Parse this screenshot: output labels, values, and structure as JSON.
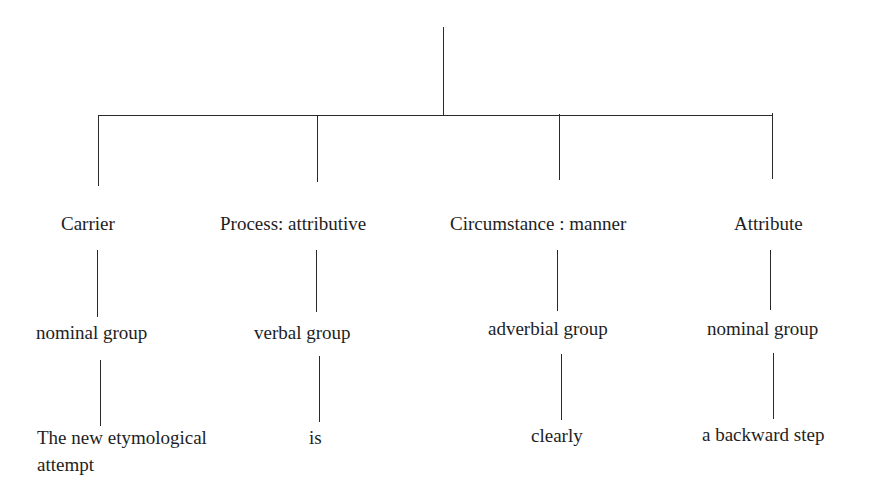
{
  "diagram": {
    "type": "tree",
    "root": "",
    "columns": [
      {
        "function": "Carrier",
        "group": "nominal group",
        "text_line1": "The new etymological",
        "text_line2": "attempt"
      },
      {
        "function": "Process: attributive",
        "group": "verbal group",
        "text_line1": "is"
      },
      {
        "function": "Circumstance : manner",
        "group": "adverbial group",
        "text_line1": "clearly"
      },
      {
        "function": "Attribute",
        "group": "nominal group",
        "text_line1": "a backward step"
      }
    ]
  }
}
